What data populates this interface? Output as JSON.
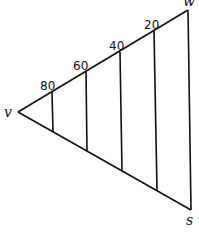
{
  "diagram": {
    "vertices": {
      "v": {
        "label": "v",
        "x": 18,
        "y": 112
      },
      "w": {
        "label": "w",
        "x": 188,
        "y": 10
      },
      "s": {
        "label": "s",
        "x": 191,
        "y": 210
      }
    },
    "divisions": [
      {
        "label": "80",
        "x": 52
      },
      {
        "label": "60",
        "x": 86
      },
      {
        "label": "40",
        "x": 121
      },
      {
        "label": "20",
        "x": 156
      }
    ],
    "colors": {
      "line": "#111111",
      "background": "#ffffff"
    }
  }
}
